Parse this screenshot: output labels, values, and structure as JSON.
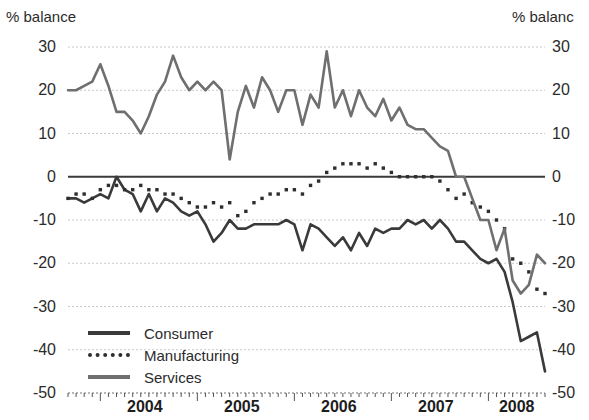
{
  "axis_titles": {
    "left": "% balance",
    "right": "% balanc"
  },
  "legend": {
    "items": [
      {
        "label": "Consumer",
        "key": "consumer",
        "style": "solid",
        "color": "#3a3a3a"
      },
      {
        "label": "Manufacturing",
        "key": "manufacturing",
        "style": "dotted",
        "color": "#2e2e2e"
      },
      {
        "label": "Services",
        "key": "services",
        "style": "solid",
        "color": "#6f6f6f"
      }
    ]
  },
  "chart_data": {
    "type": "line",
    "title": "",
    "subtitle": "",
    "xlabel": "",
    "ylabel": "% balance",
    "ylabel_right": "% balanc",
    "ylim": [
      -50,
      30
    ],
    "yticks": [
      30,
      20,
      10,
      0,
      -10,
      -20,
      -30,
      -40,
      -50
    ],
    "ytick_labels": [
      "30",
      "20",
      "10",
      "0",
      "-10",
      "-20",
      "-30",
      "-40",
      "-50"
    ],
    "xlim": [
      "2003-09",
      "2008-09"
    ],
    "xticks": [
      "2004",
      "2005",
      "2006",
      "2007",
      "2008"
    ],
    "xtick_labels": [
      "2004",
      "2005",
      "2006",
      "2007",
      "2008"
    ],
    "minor_xticks": "monthly",
    "grid": "horizontal-dotted",
    "zero_line": true,
    "legend_position": "lower-left-inside",
    "x": [
      "2003-09",
      "2003-10",
      "2003-11",
      "2003-12",
      "2004-01",
      "2004-02",
      "2004-03",
      "2004-04",
      "2004-05",
      "2004-06",
      "2004-07",
      "2004-08",
      "2004-09",
      "2004-10",
      "2004-11",
      "2004-12",
      "2005-01",
      "2005-02",
      "2005-03",
      "2005-04",
      "2005-05",
      "2005-06",
      "2005-07",
      "2005-08",
      "2005-09",
      "2005-10",
      "2005-11",
      "2005-12",
      "2006-01",
      "2006-02",
      "2006-03",
      "2006-04",
      "2006-05",
      "2006-06",
      "2006-07",
      "2006-08",
      "2006-09",
      "2006-10",
      "2006-11",
      "2006-12",
      "2007-01",
      "2007-02",
      "2007-03",
      "2007-04",
      "2007-05",
      "2007-06",
      "2007-07",
      "2007-08",
      "2007-09",
      "2007-10",
      "2007-11",
      "2007-12",
      "2008-01",
      "2008-02",
      "2008-03",
      "2008-04",
      "2008-05",
      "2008-06",
      "2008-07",
      "2008-08"
    ],
    "series": [
      {
        "name": "Consumer",
        "color": "#3a3a3a",
        "style": "solid",
        "values": [
          -5,
          -5,
          -6,
          -5,
          -4,
          -5,
          0,
          -3,
          -4,
          -8,
          -4,
          -8,
          -5,
          -6,
          -8,
          -9,
          -8,
          -11,
          -15,
          -13,
          -10,
          -12,
          -12,
          -11,
          -11,
          -11,
          -11,
          -10,
          -11,
          -17,
          -11,
          -12,
          -14,
          -16,
          -14,
          -17,
          -13,
          -16,
          -12,
          -13,
          -12,
          -12,
          -10,
          -11,
          -10,
          -12,
          -10,
          -12,
          -15,
          -15,
          -17,
          -19,
          -20,
          -19,
          -22,
          -29,
          -38,
          -37,
          -36,
          -45
        ]
      },
      {
        "name": "Manufacturing",
        "color": "#2e2e2e",
        "style": "dotted",
        "values": [
          -5,
          -4,
          -4,
          -5,
          -3,
          -2,
          -2,
          -3,
          -3,
          -2,
          -3,
          -3,
          -4,
          -4,
          -5,
          -6,
          -7,
          -7,
          -6,
          -7,
          -6,
          -9,
          -8,
          -6,
          -5,
          -4,
          -4,
          -3,
          -3,
          -4,
          -2,
          -1,
          1,
          2,
          3,
          3,
          3,
          2,
          3,
          2,
          1,
          0,
          0,
          0,
          0,
          0,
          -1,
          -3,
          -5,
          -4,
          -6,
          -7,
          -8,
          -10,
          -12,
          -19,
          -20,
          -22,
          -26,
          -27
        ]
      },
      {
        "name": "Services",
        "color": "#6f6f6f",
        "style": "solid",
        "values": [
          20,
          20,
          21,
          22,
          26,
          21,
          15,
          15,
          13,
          10,
          14,
          19,
          22,
          28,
          23,
          20,
          22,
          20,
          22,
          20,
          4,
          15,
          21,
          16,
          23,
          20,
          15,
          20,
          20,
          12,
          19,
          16,
          29,
          16,
          20,
          14,
          20,
          16,
          14,
          18,
          13,
          16,
          12,
          11,
          11,
          9,
          7,
          6,
          0,
          0,
          -5,
          -10,
          -10,
          -17,
          -12,
          -24,
          -27,
          -25,
          -18,
          -20
        ]
      }
    ]
  }
}
